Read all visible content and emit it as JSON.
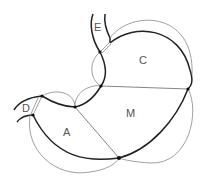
{
  "diagram": {
    "title": "",
    "colors": {
      "outline": "#222222",
      "arcs": "#888888",
      "label": "#555555",
      "background": "#ffffff"
    },
    "regions": [
      {
        "id": "E",
        "label": "E",
        "x": 94,
        "y": 24
      },
      {
        "id": "C",
        "label": "C",
        "x": 140,
        "y": 56
      },
      {
        "id": "M",
        "label": "M",
        "x": 127,
        "y": 109
      },
      {
        "id": "A",
        "label": "A",
        "x": 63,
        "y": 127
      },
      {
        "id": "D",
        "label": "D",
        "x": 22,
        "y": 103
      }
    ],
    "nodes": [
      {
        "x": 100,
        "y": 52
      },
      {
        "x": 101,
        "y": 86
      },
      {
        "x": 188,
        "y": 89
      },
      {
        "x": 75,
        "y": 107
      },
      {
        "x": 42,
        "y": 96
      },
      {
        "x": 33,
        "y": 115
      },
      {
        "x": 119,
        "y": 158
      }
    ]
  }
}
